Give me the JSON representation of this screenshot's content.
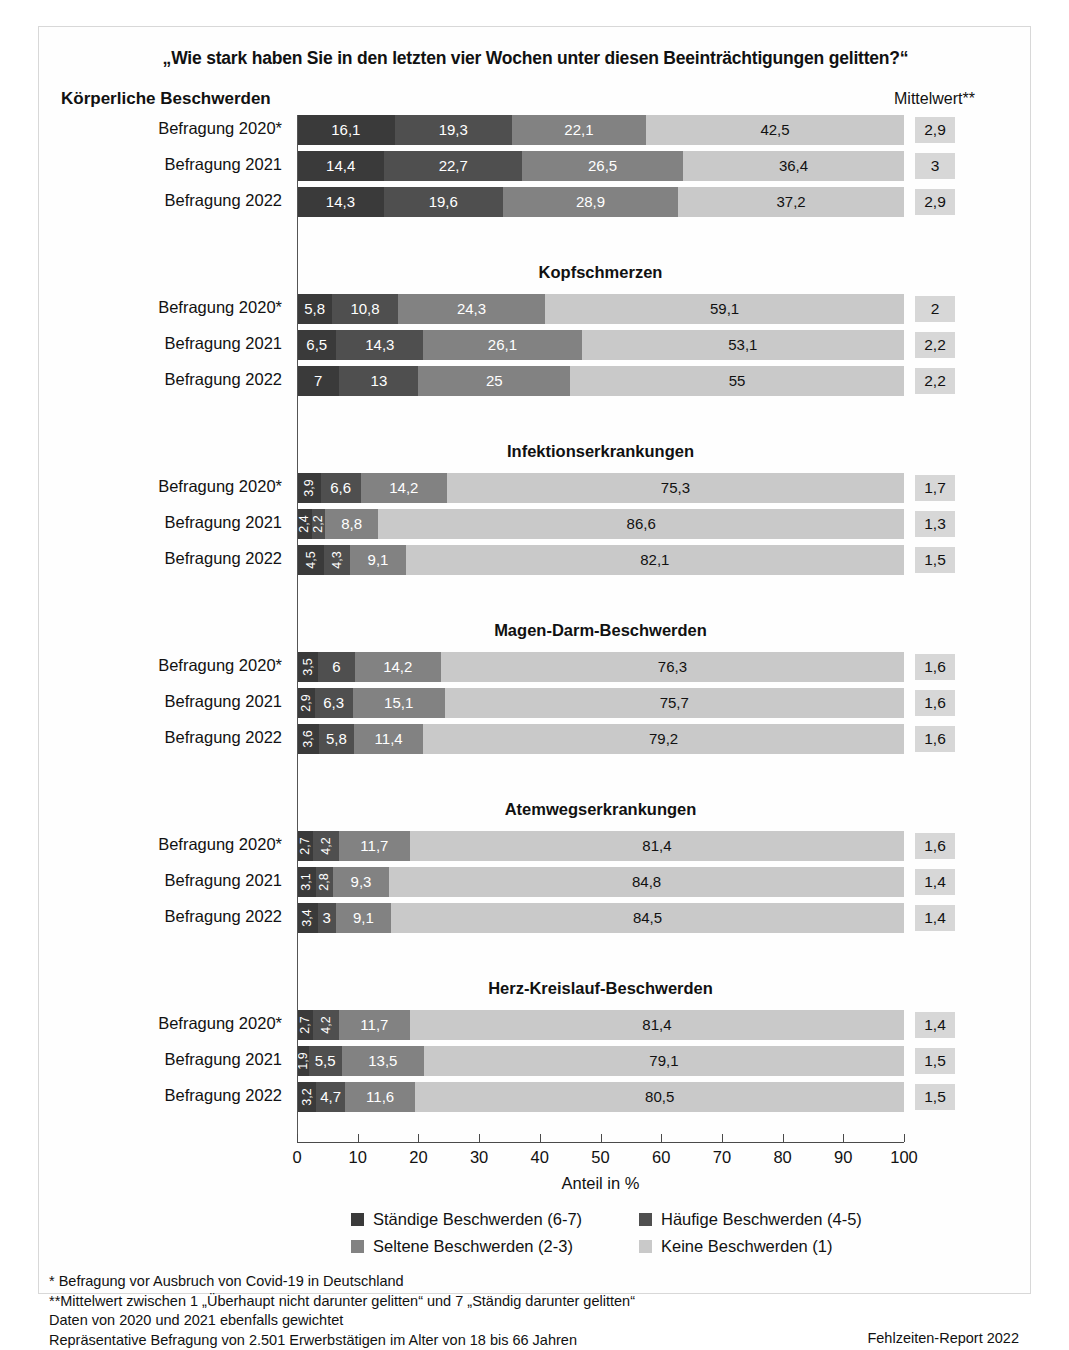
{
  "title": "„Wie stark haben Sie in den letzten vier Wochen unter diesen Beeinträchtigungen gelitten?“",
  "header": {
    "left": "Körperliche Beschwerden",
    "right": "Mittelwert**"
  },
  "axis": {
    "title": "Anteil in %",
    "ticks": [
      "0",
      "10",
      "20",
      "30",
      "40",
      "50",
      "60",
      "70",
      "80",
      "90",
      "100"
    ]
  },
  "legend": [
    {
      "label": "Ständige Beschwerden (6-7)",
      "color": "#3a3a3a"
    },
    {
      "label": "Häufige Beschwerden (4-5)",
      "color": "#4f4f4f"
    },
    {
      "label": "Seltene Beschwerden (2-3)",
      "color": "#828282"
    },
    {
      "label": "Keine Beschwerden (1)",
      "color": "#c9c9c9"
    }
  ],
  "notes": [
    "*  Befragung vor Ausbruch von Covid-19 in Deutschland",
    "**Mittelwert zwischen 1 „Überhaupt nicht darunter gelitten“ und 7 „Ständig darunter gelitten“",
    "Daten von 2020 und 2021 ebenfalls gewichtet",
    "Repräsentative Befragung von 2.501 Erwerbstätigen im Alter von 18 bis 66 Jahren"
  ],
  "source": "Fehlzeiten-Report 2022",
  "chart_data": {
    "type": "bar",
    "subtype": "stacked-horizontal-100",
    "title": "„Wie stark haben Sie in den letzten vier Wochen unter diesen Beeinträchtigungen gelitten?“",
    "xlabel": "Anteil in %",
    "ylabel": "",
    "xlim": [
      0,
      100
    ],
    "grid": false,
    "legend_position": "bottom",
    "series_names": [
      "Ständige Beschwerden (6-7)",
      "Häufige Beschwerden (4-5)",
      "Seltene Beschwerden (2-3)",
      "Keine Beschwerden (1)"
    ],
    "series_colors": [
      "#3a3a3a",
      "#4f4f4f",
      "#828282",
      "#c9c9c9"
    ],
    "mean_column_header": "Mittelwert**",
    "groups": [
      {
        "name": "Rücken- oder Gelenkbeschwerden",
        "rows": [
          {
            "label": "Befragung 2020*",
            "values": [
              16.1,
              19.3,
              22.1,
              42.5
            ],
            "labels": [
              "16,1",
              "19,3",
              "22,1",
              "42,5"
            ],
            "mean": "2,9"
          },
          {
            "label": "Befragung 2021",
            "values": [
              14.4,
              22.7,
              26.5,
              36.4
            ],
            "labels": [
              "14,4",
              "22,7",
              "26,5",
              "36,4"
            ],
            "mean": "3"
          },
          {
            "label": "Befragung 2022",
            "values": [
              14.3,
              19.6,
              28.9,
              37.2
            ],
            "labels": [
              "14,3",
              "19,6",
              "28,9",
              "37,2"
            ],
            "mean": "2,9"
          }
        ]
      },
      {
        "name": "Kopfschmerzen",
        "rows": [
          {
            "label": "Befragung 2020*",
            "values": [
              5.8,
              10.8,
              24.3,
              59.1
            ],
            "labels": [
              "5,8",
              "10,8",
              "24,3",
              "59,1"
            ],
            "mean": "2"
          },
          {
            "label": "Befragung 2021",
            "values": [
              6.5,
              14.3,
              26.1,
              53.1
            ],
            "labels": [
              "6,5",
              "14,3",
              "26,1",
              "53,1"
            ],
            "mean": "2,2"
          },
          {
            "label": "Befragung 2022",
            "values": [
              7,
              13,
              25,
              55
            ],
            "labels": [
              "7",
              "13",
              "25",
              "55"
            ],
            "mean": "2,2"
          }
        ]
      },
      {
        "name": "Infektionserkrankungen",
        "rows": [
          {
            "label": "Befragung 2020*",
            "values": [
              3.9,
              6.6,
              14.2,
              75.3
            ],
            "labels": [
              "3,9",
              "6,6",
              "14,2",
              "75,3"
            ],
            "rotated": [
              true,
              false,
              false,
              false
            ],
            "mean": "1,7"
          },
          {
            "label": "Befragung 2021",
            "values": [
              2.4,
              2.2,
              8.8,
              86.6
            ],
            "labels": [
              "2,4",
              "2,2",
              "8,8",
              "86,6"
            ],
            "rotated": [
              true,
              true,
              false,
              false
            ],
            "mean": "1,3"
          },
          {
            "label": "Befragung 2022",
            "values": [
              4.5,
              4.3,
              9.1,
              82.1
            ],
            "labels": [
              "4,5",
              "4,3",
              "9,1",
              "82,1"
            ],
            "rotated": [
              true,
              true,
              false,
              false
            ],
            "mean": "1,5"
          }
        ]
      },
      {
        "name": "Magen-Darm-Beschwerden",
        "rows": [
          {
            "label": "Befragung 2020*",
            "values": [
              3.5,
              6,
              14.2,
              76.3
            ],
            "labels": [
              "3,5",
              "6",
              "14,2",
              "76,3"
            ],
            "rotated": [
              true,
              false,
              false,
              false
            ],
            "mean": "1,6"
          },
          {
            "label": "Befragung 2021",
            "values": [
              2.9,
              6.3,
              15.1,
              75.7
            ],
            "labels": [
              "2,9",
              "6,3",
              "15,1",
              "75,7"
            ],
            "rotated": [
              true,
              false,
              false,
              false
            ],
            "mean": "1,6"
          },
          {
            "label": "Befragung 2022",
            "values": [
              3.6,
              5.8,
              11.4,
              79.2
            ],
            "labels": [
              "3,6",
              "5,8",
              "11,4",
              "79,2"
            ],
            "rotated": [
              true,
              false,
              false,
              false
            ],
            "mean": "1,6"
          }
        ]
      },
      {
        "name": "Atemwegserkrankungen",
        "rows": [
          {
            "label": "Befragung 2020*",
            "values": [
              2.7,
              4.2,
              11.7,
              81.4
            ],
            "labels": [
              "2,7",
              "4,2",
              "11,7",
              "81,4"
            ],
            "rotated": [
              true,
              true,
              false,
              false
            ],
            "mean": "1,6"
          },
          {
            "label": "Befragung 2021",
            "values": [
              3.1,
              2.8,
              9.3,
              84.8
            ],
            "labels": [
              "3,1",
              "2,8",
              "9,3",
              "84,8"
            ],
            "rotated": [
              true,
              true,
              false,
              false
            ],
            "mean": "1,4"
          },
          {
            "label": "Befragung 2022",
            "values": [
              3.4,
              3,
              9.1,
              84.5
            ],
            "labels": [
              "3,4",
              "3",
              "9,1",
              "84,5"
            ],
            "rotated": [
              true,
              false,
              false,
              false
            ],
            "mean": "1,4"
          }
        ]
      },
      {
        "name": "Herz-Kreislauf-Beschwerden",
        "rows": [
          {
            "label": "Befragung 2020*",
            "values": [
              2.7,
              4.2,
              11.7,
              81.4
            ],
            "labels": [
              "2,7",
              "4,2",
              "11,7",
              "81,4"
            ],
            "rotated": [
              true,
              true,
              false,
              false
            ],
            "mean": "1,4"
          },
          {
            "label": "Befragung 2021",
            "values": [
              1.9,
              5.5,
              13.5,
              79.1
            ],
            "labels": [
              "1,9",
              "5,5",
              "13,5",
              "79,1"
            ],
            "rotated": [
              true,
              false,
              false,
              false
            ],
            "mean": "1,5"
          },
          {
            "label": "Befragung 2022",
            "values": [
              3.2,
              4.7,
              11.6,
              80.5
            ],
            "labels": [
              "3,2",
              "4,7",
              "11,6",
              "80,5"
            ],
            "rotated": [
              true,
              false,
              false,
              false
            ],
            "mean": "1,5"
          }
        ]
      }
    ]
  }
}
